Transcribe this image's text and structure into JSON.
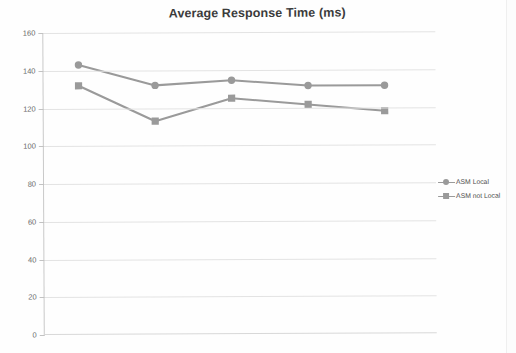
{
  "chart_data": {
    "type": "line",
    "title": "Average Response Time (ms)",
    "xlabel": "",
    "ylabel": "",
    "ylim": [
      0,
      160
    ],
    "ytick_step": 20,
    "yticks": [
      "0",
      "20",
      "40",
      "60",
      "80",
      "100",
      "120",
      "140",
      "160"
    ],
    "grid": true,
    "legend_position": "right",
    "x": [
      1,
      2,
      3,
      4,
      5
    ],
    "xtick_labels": [
      "",
      "",
      "",
      "",
      ""
    ],
    "series": [
      {
        "name": "ASM Local",
        "marker": "circle",
        "color": "#9a9a9a",
        "values": [
          143,
          132,
          134.5,
          131.5,
          131.5
        ]
      },
      {
        "name": "ASM not Local",
        "marker": "square",
        "color": "#9a9a9a",
        "values": [
          132,
          113,
          125,
          121.5,
          118
        ]
      }
    ]
  },
  "chart": {
    "title": "Average Response Time (ms)"
  },
  "legend": {
    "items": [
      {
        "label": "ASM Local"
      },
      {
        "label": "ASM not Local"
      }
    ]
  },
  "axis": {
    "y": {
      "labels": [
        "160",
        "140",
        "120",
        "100",
        "80",
        "60",
        "40",
        "20",
        "0"
      ]
    }
  },
  "colors": {
    "series_gray": "#9a9a9a",
    "gridline": "#e3e3e3",
    "title_text": "#3b3b3b",
    "tick_text": "#6a6a6a",
    "background": "#fefefe"
  }
}
